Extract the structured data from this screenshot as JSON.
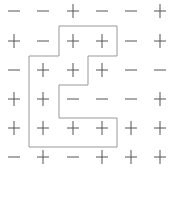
{
  "grid": {
    "rows": 6,
    "cols": 6,
    "cells": [
      [
        "-",
        "-",
        "+",
        "-",
        "-",
        "+"
      ],
      [
        "+",
        "-",
        "+",
        "+",
        "-",
        "+"
      ],
      [
        "-",
        "+",
        "+",
        "+",
        "-",
        "-"
      ],
      [
        "+",
        "+",
        "-",
        "-",
        "-",
        "+"
      ],
      [
        "+",
        "+",
        "+",
        "+",
        "+",
        "+"
      ],
      [
        "-",
        "+",
        "-",
        "+",
        "+",
        "+"
      ]
    ]
  },
  "outline": {
    "color": "#999999",
    "points": [
      [
        59,
        26
      ],
      [
        117,
        26
      ],
      [
        117,
        56
      ],
      [
        88,
        56
      ],
      [
        88,
        85
      ],
      [
        59,
        85
      ],
      [
        59,
        118
      ],
      [
        117,
        118
      ],
      [
        117,
        147
      ],
      [
        29,
        147
      ],
      [
        29,
        56
      ],
      [
        59,
        56
      ]
    ]
  },
  "colors": {
    "symbol": "#555555",
    "background": "#ffffff"
  }
}
